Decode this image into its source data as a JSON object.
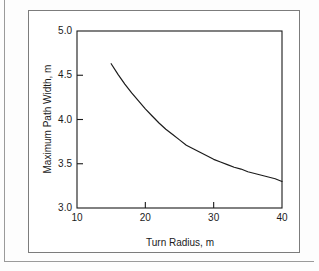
{
  "figure": {
    "frame_color": "#7c7c7c",
    "background": "#ffffff",
    "curve_color": "#1b1b1b"
  },
  "chart_data": {
    "type": "line",
    "title": "",
    "xlabel": "Turn Radius, m",
    "ylabel": "Maximum Path Width, m",
    "xlim": [
      10,
      40
    ],
    "ylim": [
      3.0,
      5.0
    ],
    "xticks": [
      10,
      20,
      30,
      40
    ],
    "xtick_labels": [
      "10",
      "20",
      "30",
      "40"
    ],
    "yticks": [
      3.0,
      3.5,
      4.0,
      4.5,
      5.0
    ],
    "ytick_labels": [
      "3.0",
      "3.5",
      "4.0",
      "4.5",
      "5.0"
    ],
    "grid": false,
    "legend": "none",
    "series": [
      {
        "name": "Maximum Path Width",
        "x": [
          15.0,
          16.0,
          17.0,
          18.0,
          19.0,
          20.0,
          21.0,
          22.0,
          23.0,
          24.0,
          25.0,
          26.0,
          27.0,
          28.0,
          29.0,
          30.0,
          31.0,
          32.0,
          33.0,
          34.0,
          35.0,
          36.0,
          37.0,
          38.0,
          39.0,
          40.0
        ],
        "values": [
          4.63,
          4.51,
          4.4,
          4.3,
          4.21,
          4.12,
          4.04,
          3.96,
          3.89,
          3.83,
          3.77,
          3.71,
          3.67,
          3.63,
          3.59,
          3.55,
          3.52,
          3.49,
          3.46,
          3.44,
          3.41,
          3.39,
          3.37,
          3.35,
          3.33,
          3.3
        ]
      }
    ]
  },
  "axes": {
    "x_title": "Turn Radius, m",
    "y_title": "Maximum Path Width, m"
  }
}
